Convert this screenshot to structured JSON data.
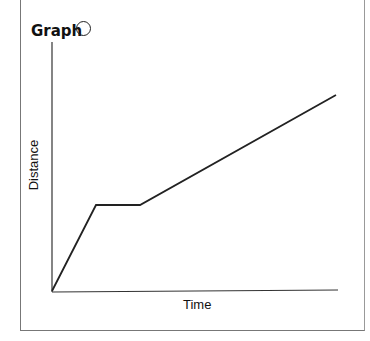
{
  "header": {
    "title": "Graph"
  },
  "chart_data": {
    "type": "line",
    "title": "Graph",
    "xlabel": "Time",
    "ylabel": "Distance",
    "x": [
      0,
      1,
      2,
      6.5
    ],
    "series": [
      {
        "name": "Distance vs Time",
        "values": [
          0,
          2,
          2,
          4.5
        ]
      }
    ],
    "points_px": [
      [
        52,
        291
      ],
      [
        96,
        205
      ],
      [
        140,
        205
      ],
      [
        336,
        95
      ]
    ],
    "grid": false,
    "ticks": false
  }
}
